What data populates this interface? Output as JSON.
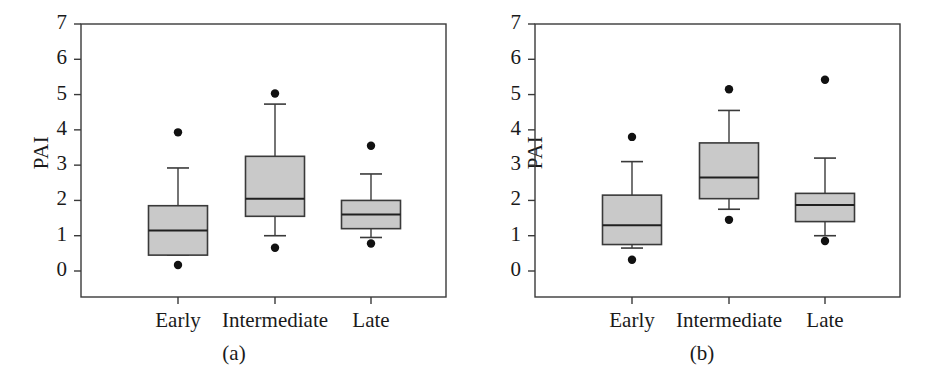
{
  "figure": {
    "width": 937,
    "height": 382,
    "background": "#ffffff",
    "line_color": "#3a3a3a",
    "box_fill": "#c9c9c9",
    "marker_color": "#111111"
  },
  "panels": [
    {
      "id": "a",
      "caption": "(a)",
      "ylabel": "PAI",
      "y_ticks": [
        "7",
        "6",
        "5",
        "4",
        "3",
        "2",
        "1",
        "0"
      ],
      "categories": [
        "Early",
        "Intermediate",
        "Late"
      ]
    },
    {
      "id": "b",
      "caption": "(b)",
      "ylabel": "PAI",
      "y_ticks": [
        "7",
        "6",
        "5",
        "4",
        "3",
        "2",
        "1",
        "0"
      ],
      "categories": [
        "Early",
        "Intermediate",
        "Late"
      ]
    }
  ],
  "chart_data": [
    {
      "type": "box",
      "panel": "a",
      "title": "(a)",
      "xlabel": "",
      "ylabel": "PAI",
      "ylim": [
        0,
        7
      ],
      "ytick_values": [
        0,
        1,
        2,
        3,
        4,
        5,
        6,
        7
      ],
      "grid": false,
      "legend": "none",
      "categories": [
        "Early",
        "Intermediate",
        "Late"
      ],
      "boxes": [
        {
          "category": "Early",
          "whisker_low": 0.45,
          "q1": 0.45,
          "median": 1.15,
          "q3": 1.85,
          "whisker_high": 2.92,
          "outliers": [
            3.93,
            0.17
          ]
        },
        {
          "category": "Intermediate",
          "whisker_low": 1.0,
          "q1": 1.55,
          "median": 2.05,
          "q3": 3.25,
          "whisker_high": 4.73,
          "outliers": [
            5.03,
            0.66
          ]
        },
        {
          "category": "Late",
          "whisker_low": 0.95,
          "q1": 1.2,
          "median": 1.6,
          "q3": 2.0,
          "whisker_high": 2.75,
          "outliers": [
            3.55,
            0.78
          ]
        }
      ]
    },
    {
      "type": "box",
      "panel": "b",
      "title": "(b)",
      "xlabel": "",
      "ylabel": "PAI",
      "ylim": [
        0,
        7
      ],
      "ytick_values": [
        0,
        1,
        2,
        3,
        4,
        5,
        6,
        7
      ],
      "grid": false,
      "legend": "none",
      "categories": [
        "Early",
        "Intermediate",
        "Late"
      ],
      "boxes": [
        {
          "category": "Early",
          "whisker_low": 0.65,
          "q1": 0.75,
          "median": 1.3,
          "q3": 2.15,
          "whisker_high": 3.1,
          "outliers": [
            3.8,
            0.32
          ]
        },
        {
          "category": "Intermediate",
          "whisker_low": 1.75,
          "q1": 2.05,
          "median": 2.65,
          "q3": 3.63,
          "whisker_high": 4.55,
          "outliers": [
            5.15,
            1.45
          ]
        },
        {
          "category": "Late",
          "whisker_low": 1.0,
          "q1": 1.4,
          "median": 1.87,
          "q3": 2.2,
          "whisker_high": 3.2,
          "outliers": [
            5.42,
            0.85
          ]
        }
      ]
    }
  ]
}
